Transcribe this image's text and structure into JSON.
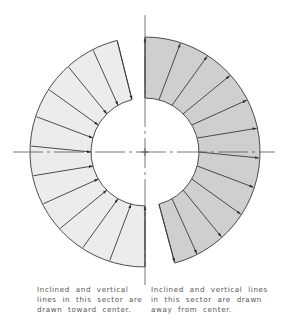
{
  "figure": {
    "center": [
      145,
      152
    ],
    "outer_radius": 115,
    "inner_radius": 54,
    "axes": {
      "horizontal": {
        "x1": 13,
        "x2": 275
      },
      "vertical": {
        "y1": 15,
        "y2": 285
      }
    },
    "sectors": [
      {
        "name": "right-sector",
        "start_angle": 0,
        "end_angle": 165,
        "fill": "#cfcfcf",
        "arrow_direction": "away-from-center",
        "line_angles": [
          0,
          15,
          30,
          45,
          60,
          75,
          90,
          105,
          120,
          135,
          150,
          165
        ]
      },
      {
        "name": "left-sector",
        "start_angle": 180,
        "end_angle": 346,
        "fill": "#ececec",
        "arrow_direction": "toward-center",
        "line_angles": [
          180,
          195,
          210,
          225,
          240,
          255,
          270,
          285,
          300,
          315,
          330,
          346
        ]
      }
    ],
    "stroke_color": "#3a3a3a",
    "axis_color": "#555555"
  },
  "captions": {
    "left": "Inclined  and  vertical\nlines  in  this  sector  are\ndrawn  toward  center.",
    "right": "Inclined  and  vertical  lines\nin  this  sector  are  drawn\naway  from  center."
  }
}
